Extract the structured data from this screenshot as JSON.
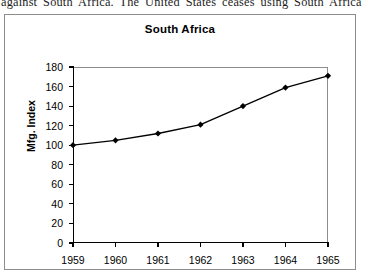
{
  "caption": {
    "text": "against South Africa. The United States ceases using South Africa"
  },
  "figure": {
    "title": "South Africa"
  },
  "chart_data": {
    "type": "line",
    "title": "South Africa",
    "xlabel": "",
    "ylabel": "Mfg. Index",
    "x": [
      1959,
      1960,
      1961,
      1962,
      1963,
      1964,
      1965
    ],
    "xtick_labels": [
      "1959",
      "1960",
      "1961",
      "1962",
      "1963",
      "1964",
      "1965"
    ],
    "values": [
      100,
      105,
      112,
      121,
      140,
      159,
      171
    ],
    "ytick_labels": [
      "0",
      "20",
      "40",
      "60",
      "80",
      "100",
      "120",
      "140",
      "160",
      "180"
    ],
    "yticks": [
      0,
      20,
      40,
      60,
      80,
      100,
      120,
      140,
      160,
      180
    ],
    "ylim": [
      0,
      180
    ],
    "xlim": [
      1959,
      1965
    ],
    "grid": false,
    "legend": null,
    "marker": "diamond",
    "line_color": "#000000",
    "marker_color": "#000000",
    "frame_color": "#8d8d8d"
  }
}
